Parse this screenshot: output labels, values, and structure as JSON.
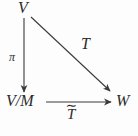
{
  "diagram": {
    "background_color": "#fdfdfd",
    "stroke_color": "#3a3a3a",
    "text_color": "#2b2b2b",
    "nodes": [
      {
        "id": "V",
        "label": "V",
        "position": "top-left"
      },
      {
        "id": "V/M",
        "label": "V/M",
        "position": "bottom-left"
      },
      {
        "id": "W",
        "label": "W",
        "position": "bottom-right"
      }
    ],
    "arrows": [
      {
        "id": "pi-arrow",
        "label": "π",
        "from": "V",
        "to": "V/M",
        "direction": "down",
        "label_side": "left",
        "x1": 24,
        "y1": 18,
        "x2": 24,
        "y2": 93
      },
      {
        "id": "T-arrow",
        "label": "T",
        "from": "V",
        "to": "W",
        "direction": "diagonal-down-right",
        "label_side": "above-right",
        "x1": 31,
        "y1": 17,
        "x2": 111,
        "y2": 92
      },
      {
        "id": "Ttilde-arrow",
        "label": "T",
        "label_accent": "∼",
        "label_full": "T̃",
        "from": "V/M",
        "to": "W",
        "direction": "right",
        "label_side": "below",
        "x1": 46,
        "y1": 102,
        "x2": 112,
        "y2": 102
      }
    ]
  }
}
